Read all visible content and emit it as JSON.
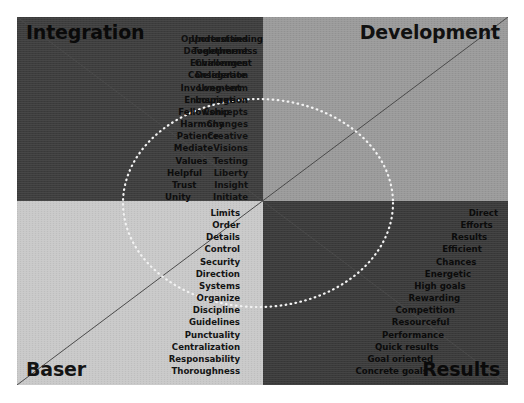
{
  "chart_data": {
    "type": "scatter",
    "layout": "2x2 quadrant matrix with diagonal axes and dotted ellipse overlay",
    "legend": "none",
    "grid": false,
    "quadrants": [
      {
        "id": "top-left",
        "label": "Integration",
        "position": "top-left",
        "background_color": "#3d3d3d",
        "text_color": "#0d0d0d",
        "keywords": [
          "Understanding",
          "Togetherness",
          "Environment",
          "Considerate",
          "Involvement",
          "Encourage",
          "Fellowship",
          "Harmony",
          "Patience",
          "Mediate",
          "Values",
          "Helpful",
          "Trust",
          "Unity"
        ]
      },
      {
        "id": "top-right",
        "label": "Development",
        "position": "top-right",
        "background_color": "#9a9a9a",
        "text_color": "#101010",
        "keywords": [
          "Opportunities",
          "Development",
          "Challenges",
          "Delegation",
          "Long-term",
          "Inspiration",
          "Concepts",
          "Changes",
          "Creative",
          "Visions",
          "Testing",
          "Liberty",
          "Insight",
          "Initiate"
        ]
      },
      {
        "id": "bottom-left",
        "label": "Baser",
        "position": "bottom-left",
        "background_color": "#c9c9c9",
        "text_color": "#141414",
        "keywords": [
          "Limits",
          "Order",
          "Details",
          "Control",
          "Security",
          "Direction",
          "Systems",
          "Organize",
          "Discipline",
          "Guidelines",
          "Punctuality",
          "Centralization",
          "Responsability",
          "Thoroughness"
        ]
      },
      {
        "id": "bottom-right",
        "label": "Results",
        "position": "bottom-right",
        "background_color": "#3a3a3a",
        "text_color": "#0b0b0b",
        "keywords": [
          "Direct",
          "Efforts",
          "Results",
          "Efficient",
          "Chances",
          "Energetic",
          "High goals",
          "Rewarding",
          "Competition",
          "Resourceful",
          "Performance",
          "Quick results",
          "Goal oriented",
          "Concrete goals"
        ]
      }
    ],
    "overlay": {
      "ellipse": {
        "center_x": 241,
        "center_y": 186,
        "radius_x": 135,
        "radius_y": 104,
        "style": "dotted",
        "color": "#f2f2f2"
      },
      "diagonals": [
        {
          "from": "top-left",
          "to": "bottom-right",
          "color": "#4a4a4a"
        },
        {
          "from": "bottom-left",
          "to": "top-right",
          "color": "#4a4a4a"
        }
      ]
    }
  },
  "colors": {
    "page_background": "#ffffff",
    "quad_top_left": "#3d3d3d",
    "quad_top_right": "#9a9a9a",
    "quad_bottom_left": "#c9c9c9",
    "quad_bottom_right": "#3a3a3a",
    "ellipse": "#f2f2f2",
    "diagonal": "#4a4a4a"
  }
}
